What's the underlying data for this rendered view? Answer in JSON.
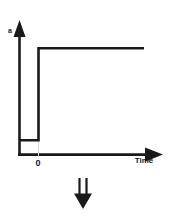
{
  "figure": {
    "title": "",
    "background_color": "#ffffff",
    "stroke_color": "#1a1a1a",
    "axes": {
      "y_axis": {
        "label": "a",
        "name": "amplitude-axis",
        "arrow": "up"
      },
      "x_axis": {
        "label": "Time",
        "name": "time-axis",
        "arrow": "right",
        "ticks": [
          {
            "label": "0",
            "position": "step-onset"
          }
        ]
      }
    },
    "curve": {
      "name": "step-function",
      "description": "unit step",
      "segments": [
        {
          "type": "low-level",
          "from_x": 0,
          "to_x": 0.13,
          "level": "low"
        },
        {
          "type": "rising-edge",
          "at_x": 0.13
        },
        {
          "type": "high-level",
          "from_x": 0.13,
          "to_x": 0.89,
          "level": "high"
        }
      ]
    },
    "annotation": {
      "name": "down-double-arrow",
      "glyph": "double-arrow-down",
      "direction": "down"
    }
  }
}
